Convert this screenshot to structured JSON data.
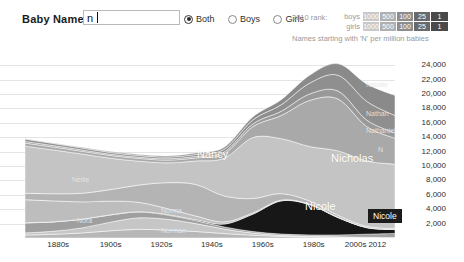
{
  "toolbar": {
    "name_label": "Baby Name >",
    "search_value": "n",
    "search_placeholder": "",
    "options": [
      {
        "label": "Both",
        "selected": true
      },
      {
        "label": "Boys",
        "selected": false
      },
      {
        "label": "Girls",
        "selected": false
      }
    ]
  },
  "legend": {
    "title": "2010 rank:",
    "rows": [
      {
        "label": "boys"
      },
      {
        "label": "girls"
      }
    ],
    "ranks": [
      "1000",
      "500",
      "100",
      "25",
      "1"
    ],
    "colors": [
      "#c9c9c9",
      "#b0b0b0",
      "#8d8d8d",
      "#6a6a6a",
      "#4a4a4a"
    ],
    "note": "Names starting with 'N' per million babies"
  },
  "chart_data": {
    "type": "area",
    "title": "Names starting with 'N' per million babies",
    "xlabel": "",
    "ylabel": "per million babies",
    "grid": true,
    "legend_position": "top-right",
    "x": [
      "1880s",
      "1890s",
      "1900s",
      "1910s",
      "1920s",
      "1930s",
      "1940s",
      "1950s",
      "1960s",
      "1970s",
      "1980s",
      "1990s",
      "2000s",
      "2012"
    ],
    "xticks": [
      "1880s",
      "1900s",
      "1920s",
      "1940s",
      "1960s",
      "1980s",
      "2000s",
      "2012"
    ],
    "yticks": [
      "24,000",
      "22,000",
      "20,000",
      "18,000",
      "16,000",
      "14,000",
      "12,000",
      "10,000",
      "8,000",
      "6,000",
      "4,000",
      "2,000"
    ],
    "ylim": [
      0,
      25000
    ],
    "total_values": [
      13800,
      13200,
      12600,
      12000,
      11600,
      11400,
      11800,
      12600,
      16800,
      19200,
      22600,
      24200,
      21400,
      19800
    ],
    "series": [
      {
        "name": "Nancy",
        "values": [
          900,
          1000,
          1200,
          1600,
          2400,
          3600,
          4400,
          3600,
          2000,
          900,
          420,
          260,
          160,
          120
        ]
      },
      {
        "name": "Nicholas",
        "values": [
          420,
          400,
          380,
          380,
          380,
          380,
          420,
          620,
          1500,
          3200,
          6400,
          7200,
          4800,
          3600
        ]
      },
      {
        "name": "Nicole",
        "values": [
          10,
          10,
          15,
          20,
          30,
          60,
          120,
          400,
          2400,
          4600,
          4200,
          2400,
          900,
          520
        ]
      },
      {
        "name": "Nellie",
        "values": [
          3200,
          2900,
          2400,
          1900,
          1300,
          820,
          500,
          300,
          180,
          110,
          80,
          60,
          40,
          30
        ]
      },
      {
        "name": "Nora",
        "values": [
          1400,
          1300,
          1200,
          1000,
          820,
          600,
          420,
          300,
          220,
          180,
          200,
          260,
          420,
          560
        ]
      },
      {
        "name": "Norma",
        "values": [
          300,
          420,
          700,
          1200,
          1600,
          1500,
          1100,
          620,
          300,
          150,
          90,
          60,
          40,
          30
        ]
      },
      {
        "name": "Norman",
        "values": [
          400,
          520,
          700,
          1000,
          1200,
          1100,
          900,
          620,
          380,
          220,
          140,
          100,
          70,
          50
        ]
      },
      {
        "name": "Natalie",
        "values": [
          60,
          70,
          90,
          110,
          140,
          160,
          200,
          280,
          420,
          700,
          1100,
          1600,
          2400,
          2800
        ]
      },
      {
        "name": "Nathan",
        "values": [
          340,
          300,
          280,
          260,
          240,
          240,
          280,
          360,
          560,
          900,
          1500,
          2200,
          2600,
          2400
        ]
      },
      {
        "name": "Nathaniel",
        "values": [
          220,
          200,
          180,
          170,
          170,
          180,
          200,
          260,
          380,
          600,
          900,
          1100,
          900,
          760
        ]
      },
      {
        "name": "other N names",
        "values": [
          6550,
          6080,
          5455,
          4360,
          3320,
          2760,
          3260,
          5240,
          8460,
          7640,
          7570,
          8960,
          9070,
          8930
        ]
      }
    ],
    "band_labels": [
      {
        "name": "Nancy",
        "x": 197,
        "y": 148,
        "size": "big"
      },
      {
        "name": "Nicholas",
        "x": 331,
        "y": 152,
        "size": "big"
      },
      {
        "name": "Nicole",
        "x": 305,
        "y": 200,
        "size": "big"
      },
      {
        "name": "Nellie",
        "x": 72,
        "y": 176,
        "size": "sm"
      },
      {
        "name": "Nora",
        "x": 77,
        "y": 217,
        "size": "sm"
      },
      {
        "name": "Norma",
        "x": 161,
        "y": 207,
        "size": "sm"
      },
      {
        "name": "Norman",
        "x": 161,
        "y": 227,
        "size": "sm"
      },
      {
        "name": "Natalie",
        "x": 366,
        "y": 81,
        "size": "sm"
      },
      {
        "name": "Nathan",
        "x": 366,
        "y": 110,
        "size": "sm"
      },
      {
        "name": "Nathaniel",
        "x": 366,
        "y": 127,
        "size": "sm"
      },
      {
        "name": "N",
        "x": 378,
        "y": 146,
        "size": "sm"
      }
    ],
    "tooltip": {
      "label": "Nicole",
      "x": 368,
      "y": 209
    }
  }
}
